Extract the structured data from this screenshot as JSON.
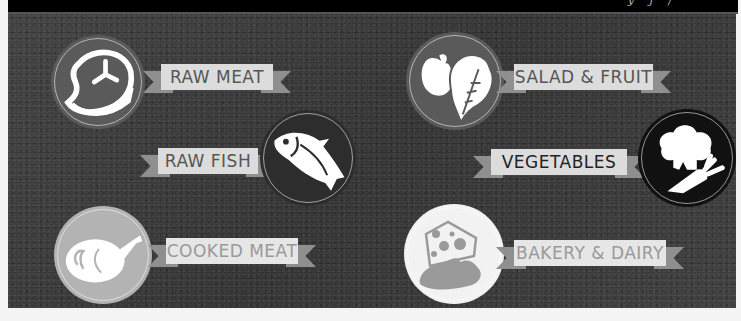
{
  "header": {
    "tagline": "y   j   /"
  },
  "colors": {
    "board": "#3b3b3b",
    "ribbon_band": "#dcdcdc",
    "ribbon_tail": "#8f8f8f",
    "label_text": "#555555"
  },
  "categories": [
    {
      "id": "raw-meat",
      "label": "RAW MEAT",
      "icon": "steak-icon",
      "badge_color": "#5a5a5a"
    },
    {
      "id": "raw-fish",
      "label": "RAW FISH",
      "icon": "fish-icon",
      "badge_color": "#2d2d2d"
    },
    {
      "id": "cooked-meat",
      "label": "COOKED MEAT",
      "icon": "roast-chicken-icon",
      "badge_color": "#b3b3b3"
    },
    {
      "id": "salad-fruit",
      "label": "SALAD & FRUIT",
      "icon": "apple-leaf-icon",
      "badge_color": "#5a5a5a"
    },
    {
      "id": "vegetables",
      "label": "VEGETABLES",
      "icon": "broccoli-carrot-icon",
      "badge_color": "#111111"
    },
    {
      "id": "bakery-dairy",
      "label": "BAKERY & DAIRY",
      "icon": "cheese-bread-icon",
      "badge_color": "#f2f2f2"
    }
  ]
}
